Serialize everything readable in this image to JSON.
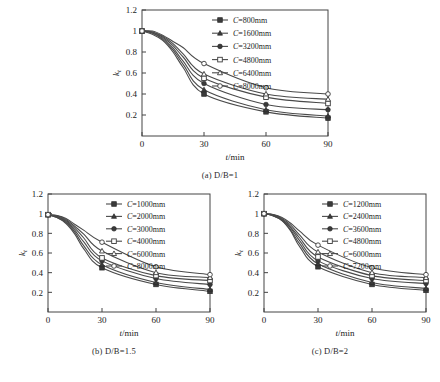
{
  "figure": {
    "bottom_caption": "",
    "panels": [
      {
        "id": "a",
        "caption": "(a)  D/B=1",
        "xlabel": "t/min",
        "ylabel": "k",
        "ylabel_sub": "t"
      },
      {
        "id": "b",
        "caption": "(b)  D/B=1.5",
        "xlabel": "t/min",
        "ylabel": "k",
        "ylabel_sub": "t"
      },
      {
        "id": "c",
        "caption": "(c)  D/B=2",
        "xlabel": "t/min",
        "ylabel": "k",
        "ylabel_sub": "t"
      }
    ]
  },
  "chart_data": [
    {
      "type": "line",
      "panel": "a",
      "title": "(a)  D/B=1",
      "xlabel": "t/min",
      "ylabel": "k_t",
      "xlim": [
        0,
        90
      ],
      "ylim": [
        0,
        1.2
      ],
      "xticks": [
        0,
        30,
        60,
        90
      ],
      "yticks": [
        0.2,
        0.4,
        0.6,
        0.8,
        1,
        1.2
      ],
      "grid": false,
      "legend_position": "top-right",
      "x": [
        0,
        5,
        10,
        15,
        20,
        30,
        60,
        90
      ],
      "series": [
        {
          "name": "C=800mm",
          "marker": "filled-square",
          "values": [
            1.0,
            0.97,
            0.91,
            0.8,
            0.65,
            0.4,
            0.23,
            0.17
          ]
        },
        {
          "name": "C=1600mm",
          "marker": "filled-triangle",
          "values": [
            1.0,
            0.98,
            0.92,
            0.82,
            0.68,
            0.44,
            0.25,
            0.19
          ]
        },
        {
          "name": "C=3200mm",
          "marker": "filled-circle",
          "values": [
            1.0,
            0.98,
            0.93,
            0.84,
            0.71,
            0.5,
            0.3,
            0.25
          ]
        },
        {
          "name": "C=4800mm",
          "marker": "open-square",
          "values": [
            1.0,
            0.99,
            0.94,
            0.86,
            0.75,
            0.55,
            0.37,
            0.31
          ]
        },
        {
          "name": "C=6400mm",
          "marker": "open-triangle",
          "values": [
            1.0,
            0.99,
            0.95,
            0.88,
            0.78,
            0.59,
            0.4,
            0.35
          ]
        },
        {
          "name": "C=8000mm",
          "marker": "open-circle",
          "values": [
            1.0,
            1.0,
            0.96,
            0.9,
            0.84,
            0.69,
            0.46,
            0.4
          ]
        }
      ]
    },
    {
      "type": "line",
      "panel": "b",
      "title": "(b)  D/B=1.5",
      "xlabel": "t/min",
      "ylabel": "k_t",
      "xlim": [
        0,
        90
      ],
      "ylim": [
        0,
        1.2
      ],
      "xticks": [
        0,
        30,
        60,
        90
      ],
      "yticks": [
        0.2,
        0.4,
        0.6,
        0.8,
        1,
        1.2
      ],
      "grid": false,
      "legend_position": "top-right",
      "x": [
        0,
        5,
        10,
        15,
        20,
        30,
        60,
        90
      ],
      "series": [
        {
          "name": "C=1000mm",
          "marker": "filled-square",
          "values": [
            0.99,
            0.96,
            0.9,
            0.79,
            0.64,
            0.45,
            0.28,
            0.21
          ]
        },
        {
          "name": "C=2000mm",
          "marker": "filled-triangle",
          "values": [
            0.99,
            0.96,
            0.91,
            0.81,
            0.67,
            0.48,
            0.3,
            0.23
          ]
        },
        {
          "name": "C=3000mm",
          "marker": "filled-circle",
          "values": [
            0.99,
            0.97,
            0.92,
            0.83,
            0.71,
            0.52,
            0.34,
            0.28
          ]
        },
        {
          "name": "C=4000mm",
          "marker": "open-square",
          "values": [
            0.99,
            0.97,
            0.93,
            0.85,
            0.75,
            0.55,
            0.37,
            0.32
          ]
        },
        {
          "name": "C=6000mm",
          "marker": "open-triangle",
          "values": [
            0.99,
            0.98,
            0.94,
            0.87,
            0.79,
            0.62,
            0.4,
            0.35
          ]
        },
        {
          "name": "C=8000mm",
          "marker": "open-circle",
          "values": [
            0.99,
            0.98,
            0.95,
            0.89,
            0.83,
            0.71,
            0.46,
            0.38
          ]
        }
      ]
    },
    {
      "type": "line",
      "panel": "c",
      "title": "(c)  D/B=2",
      "xlabel": "t/min",
      "ylabel": "k_t",
      "xlim": [
        0,
        90
      ],
      "ylim": [
        0,
        1.2
      ],
      "xticks": [
        0,
        30,
        60,
        90
      ],
      "yticks": [
        0.2,
        0.4,
        0.6,
        0.8,
        1,
        1.2
      ],
      "grid": false,
      "legend_position": "top-right",
      "x": [
        0,
        5,
        10,
        15,
        20,
        30,
        60,
        90
      ],
      "series": [
        {
          "name": "C=1200mm",
          "marker": "filled-square",
          "values": [
            1.0,
            0.98,
            0.93,
            0.82,
            0.66,
            0.46,
            0.28,
            0.22
          ]
        },
        {
          "name": "C=2400mm",
          "marker": "filled-triangle",
          "values": [
            1.0,
            0.98,
            0.93,
            0.83,
            0.69,
            0.49,
            0.3,
            0.24
          ]
        },
        {
          "name": "C=3600mm",
          "marker": "filled-circle",
          "values": [
            1.0,
            0.98,
            0.94,
            0.85,
            0.72,
            0.52,
            0.34,
            0.29
          ]
        },
        {
          "name": "C=4800mm",
          "marker": "open-square",
          "values": [
            1.0,
            0.99,
            0.94,
            0.86,
            0.75,
            0.56,
            0.37,
            0.32
          ]
        },
        {
          "name": "C=6000mm",
          "marker": "open-triangle",
          "values": [
            1.0,
            0.99,
            0.95,
            0.88,
            0.78,
            0.61,
            0.4,
            0.35
          ]
        },
        {
          "name": "C=7200mm",
          "marker": "open-circle",
          "values": [
            1.0,
            0.99,
            0.96,
            0.9,
            0.82,
            0.68,
            0.45,
            0.38
          ]
        }
      ]
    }
  ]
}
